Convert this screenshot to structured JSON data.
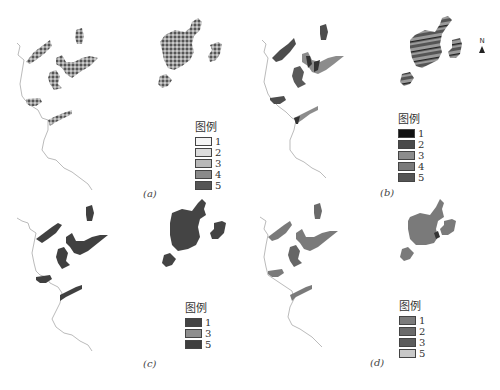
{
  "figure": {
    "panels": [
      {
        "id": "a",
        "caption": "(a)",
        "legend": {
          "title": "图例",
          "items": [
            {
              "label": "1",
              "color": "#f4f4f4"
            },
            {
              "label": "2",
              "color": "#dcdcdc"
            },
            {
              "label": "3",
              "color": "#b8b8b8"
            },
            {
              "label": "4",
              "color": "#8a8a8a"
            },
            {
              "label": "5",
              "color": "#555555"
            }
          ]
        }
      },
      {
        "id": "b",
        "caption": "(b)",
        "legend": {
          "title": "图例",
          "items": [
            {
              "label": "1",
              "color": "#111111"
            },
            {
              "label": "2",
              "color": "#4a4a4a"
            },
            {
              "label": "3",
              "color": "#8c8c8c"
            },
            {
              "label": "4",
              "color": "#7a7a7a"
            },
            {
              "label": "5",
              "color": "#555555"
            }
          ]
        },
        "north_arrow": "N"
      },
      {
        "id": "c",
        "caption": "(c)",
        "legend": {
          "title": "图例",
          "items": [
            {
              "label": "1",
              "color": "#444444"
            },
            {
              "label": "3",
              "color": "#8e8e8e"
            },
            {
              "label": "5",
              "color": "#3e3e3e"
            }
          ]
        }
      },
      {
        "id": "d",
        "caption": "(d)",
        "legend": {
          "title": "图例",
          "items": [
            {
              "label": "1",
              "color": "#7b7b7b"
            },
            {
              "label": "2",
              "color": "#6a6a6a"
            },
            {
              "label": "3",
              "color": "#5c5c5c"
            },
            {
              "label": "5",
              "color": "#c8c8c8"
            }
          ]
        }
      }
    ]
  }
}
